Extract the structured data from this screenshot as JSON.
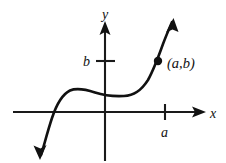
{
  "figure": {
    "background_color": "#ffffff",
    "ink_color": "#111111",
    "width": 226,
    "height": 163
  },
  "axes": {
    "x_axis": {
      "label": "x",
      "label_position": {
        "x": 212,
        "y": 118
      },
      "line": {
        "x1": 13,
        "y1": 112,
        "x2": 198,
        "y2": 112
      },
      "arrow_tip": {
        "x": 206,
        "y": 112
      },
      "has_arrow": true
    },
    "y_axis": {
      "label": "y",
      "label_position": {
        "x": 104,
        "y": 18
      },
      "line": {
        "x1": 105,
        "y1": 161,
        "x2": 105,
        "y2": 30
      },
      "arrow_tip": {
        "x": 105,
        "y": 21
      },
      "has_arrow": true
    },
    "origin": {
      "x": 105,
      "y": 112
    }
  },
  "ticks": [
    {
      "name": "a",
      "label": "a",
      "axis": "x",
      "position": {
        "x": 165,
        "y": 112
      },
      "label_position": {
        "x": 161,
        "y": 136
      },
      "mark": {
        "x1": 165,
        "y1": 104,
        "x2": 165,
        "y2": 120
      }
    },
    {
      "name": "b",
      "label": "b",
      "axis": "y",
      "position": {
        "x": 105,
        "y": 61
      },
      "label_position": {
        "x": 84,
        "y": 66
      },
      "mark": {
        "x1": 97,
        "y1": 61,
        "x2": 115,
        "y2": 61
      }
    }
  ],
  "curve": {
    "name": "function-curve",
    "description": "S-shaped increasing cubic curve",
    "path": "M 41 155 C 44 146, 47 133, 52 118 C 57 103, 63 94, 70 90.5 C 77 87.5, 86 89.5, 95 92.5 C 104 95.5, 114 96.5, 124 96 C 134 95.5, 141 91, 148 80 C 153 71, 158 58, 163 44 C 166 36, 169 29, 172 22",
    "start_arrow": {
      "tip": {
        "x": 40,
        "y": 159
      },
      "direction": "down-left"
    },
    "end_arrow": {
      "tip": {
        "x": 173,
        "y": 19
      },
      "direction": "up-right"
    },
    "x_intercept": {
      "x": 52,
      "y": 112
    },
    "local_max": {
      "x": 72,
      "y": 90
    },
    "inflection_flat": {
      "x": 120,
      "y": 96
    }
  },
  "marked_point": {
    "name": "point-a-b",
    "label": "(a,b)",
    "dot_position": {
      "x": 158,
      "y": 61
    },
    "dot_radius": 4.2,
    "label_position": {
      "x": 168,
      "y": 68
    }
  }
}
